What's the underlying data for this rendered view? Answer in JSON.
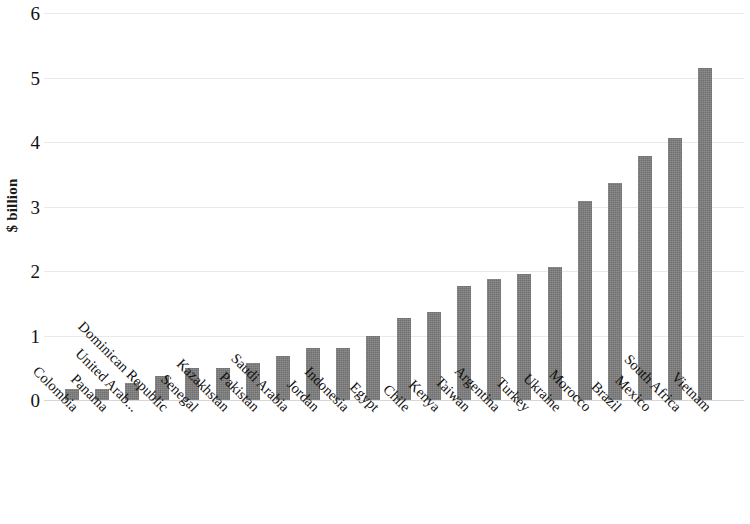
{
  "chart_data": {
    "type": "bar",
    "title": "",
    "subtitle": "",
    "xlabel": "",
    "ylabel": "$ billion",
    "ylim": [
      0,
      6
    ],
    "ytick_labels": [
      "6",
      "5",
      "4",
      "3",
      "2",
      "1",
      "0"
    ],
    "ytick_values": [
      6,
      5,
      4,
      3,
      2,
      1,
      0
    ],
    "grid": true,
    "legend": null,
    "bar_color": "#7b7b7b",
    "categories": [
      "Colombia",
      "Panama",
      "United Arab...",
      "Dominican Republic",
      "Senegal",
      "Kazakhstan",
      "Pakistan",
      "Saudi Arabia",
      "Jordan",
      "Indonesia",
      "Egypt",
      "Chile",
      "Kenya",
      "Taiwan",
      "Argentina",
      "Turkey",
      "Ukraine",
      "Morocco",
      "Brazil",
      "Mexico",
      "South Africa",
      "Vietnam"
    ],
    "values": [
      0.17,
      0.17,
      0.27,
      0.38,
      0.5,
      0.5,
      0.58,
      0.69,
      0.8,
      0.8,
      1.0,
      1.27,
      1.37,
      1.76,
      1.87,
      1.96,
      2.07,
      3.08,
      3.37,
      3.78,
      4.07,
      5.14
    ]
  }
}
